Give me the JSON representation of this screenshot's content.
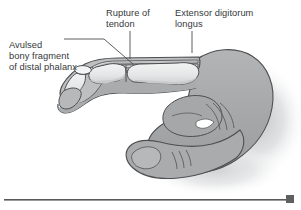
{
  "figure": {
    "kind": "medical-illustration",
    "width": 301,
    "height": 210,
    "background_color": "#ffffff"
  },
  "labels": {
    "avulsed": {
      "name": "avulsed-bony-fragment-label",
      "lines": [
        "Avulsed",
        "bony fragment",
        "of distal phalanx"
      ],
      "text": "Avulsed\nbony fragment\nof distal phalanx"
    },
    "rupture": {
      "name": "rupture-of-tendon-label",
      "lines": [
        "Rupture of",
        "tendon"
      ],
      "text": "Rupture of\ntendon"
    },
    "extensor": {
      "name": "extensor-digitorum-longus-label",
      "lines": [
        "Extensor digitorum",
        "longus"
      ],
      "text": "Extensor digitorum\nlongus"
    }
  },
  "colors": {
    "text": "#36383a",
    "leader_line": "#4a4c4e",
    "outline": "#4d4f51",
    "skin_fill": "#a9abad",
    "skin_shadow": "#8e9092",
    "bone_fill": "#e9eaea",
    "bone_shadow": "#c9cacb",
    "tendon_fill": "#dcdddd",
    "fragment_fill": "#f2f2f2",
    "drop_shadow": "#c2c4c6",
    "rule_line": "#58595b",
    "rule_square": "#5e6062"
  },
  "bottom_rule": {
    "name": "bottom-divider",
    "square_marker": "end-square-marker"
  }
}
